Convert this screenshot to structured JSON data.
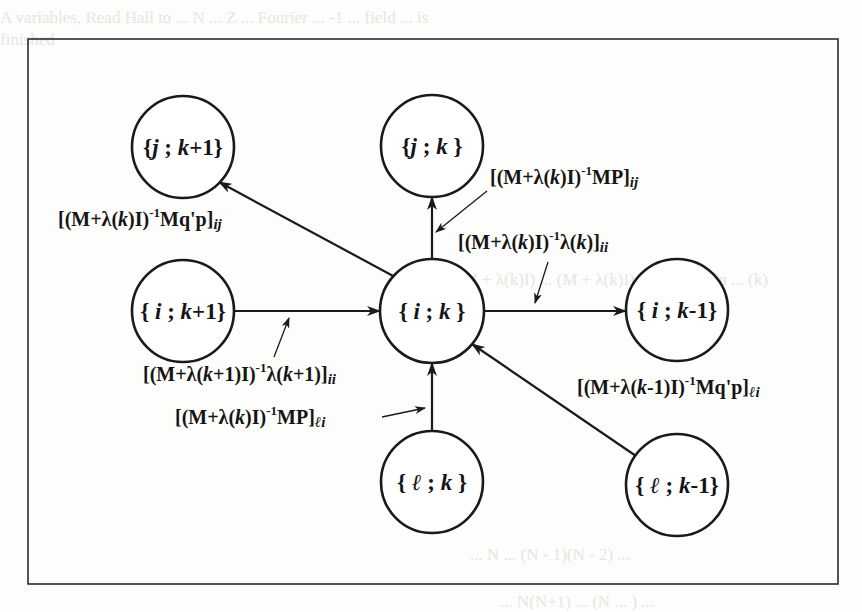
{
  "diagram": {
    "frame": {
      "x": 28,
      "y": 39,
      "width": 810,
      "height": 545
    },
    "nodes": [
      {
        "id": "j_k+1",
        "row": "j",
        "col": "k+1",
        "brace_open": "{",
        "var": "j",
        "sep": " ; ",
        "k": "k",
        "suffix": "+1",
        "brace_close": "}",
        "cx": 183,
        "cy": 147
      },
      {
        "id": "j_k",
        "row": "j",
        "col": "k",
        "brace_open": "{",
        "var": "j",
        "sep": " ; ",
        "k": "k",
        "suffix": " ",
        "brace_close": "}",
        "cx": 432,
        "cy": 146
      },
      {
        "id": "i_k+1",
        "row": "i",
        "col": "k+1",
        "brace_open": "{ ",
        "var": "i",
        "sep": " ; ",
        "k": "k",
        "suffix": "+1",
        "brace_close": "}",
        "cx": 183,
        "cy": 311
      },
      {
        "id": "i_k",
        "row": "i",
        "col": "k",
        "brace_open": "{ ",
        "var": "i",
        "sep": " ; ",
        "k": "k",
        "suffix": " ",
        "brace_close": "}",
        "cx": 432,
        "cy": 311
      },
      {
        "id": "i_k-1",
        "row": "i",
        "col": "k-1",
        "brace_open": "{ ",
        "var": "i",
        "sep": " ; ",
        "k": "k",
        "suffix": "-1",
        "brace_close": "}",
        "cx": 677,
        "cy": 310
      },
      {
        "id": "l_k",
        "row": "ℓ",
        "col": "k",
        "brace_open": "{ ",
        "var": "ℓ",
        "sep": " ; ",
        "k": "k",
        "suffix": " ",
        "brace_close": "}",
        "cx": 432,
        "cy": 482
      },
      {
        "id": "l_k-1",
        "row": "ℓ",
        "col": "k-1",
        "brace_open": "{ ",
        "var": "ℓ",
        "sep": " ; ",
        "k": "k",
        "suffix": "-1",
        "brace_close": "}",
        "cx": 677,
        "cy": 485
      }
    ],
    "edges": [
      {
        "from": "i_k",
        "to": "j_k+1"
      },
      {
        "from": "i_k",
        "to": "j_k"
      },
      {
        "from": "i_k+1",
        "to": "i_k"
      },
      {
        "from": "i_k",
        "to": "i_k-1"
      },
      {
        "from": "l_k",
        "to": "i_k"
      },
      {
        "from": "l_k-1",
        "to": "i_k"
      }
    ],
    "labels": {
      "i_k_to_j_k1": {
        "pre": "[(M+λ(",
        "var": "k",
        "mid": ")I)",
        "sup": "-1",
        "post": "Mq'p]",
        "sub": "ij"
      },
      "i_k_to_j_k_mp": {
        "pre": "[(M+λ(",
        "var": "k",
        "mid": ")I)",
        "sup": "-1",
        "post": "MP]",
        "sub": "ij"
      },
      "i_k_self_lambda": {
        "pre": "[(M+λ(",
        "var": "k",
        "mid": ")I)",
        "sup": "-1",
        "post_pre": "λ(",
        "post_var": "k",
        "post": ")]",
        "sub": "ii"
      },
      "i_k1_to_i_k": {
        "pre": "[(M+λ(",
        "var": "k",
        "mid": "+1)I)",
        "sup": "-1",
        "post_pre": "λ(",
        "post_var": "k",
        "post": "+1)]",
        "sub": "ii"
      },
      "l_k_to_i_k": {
        "pre": "[(M+λ(",
        "var": "k",
        "mid": ")I)",
        "sup": "-1",
        "post": "MP]",
        "sub": "ℓi"
      },
      "l_k1_to_i_k": {
        "pre": "[(M+λ(",
        "var": "k",
        "mid": "-1)I)",
        "sup": "-1",
        "post": "Mq'p]",
        "sub": "ℓi"
      }
    }
  },
  "background_text": {
    "line1": "A variables, Read Hall to ... N ... Z ... Fourier ... -1 ... field ... is",
    "line2": "finished",
    "line3": "Notes have presented so that all the constraint from the ... relation ... are",
    "line4": "Theorem 6.3.2 The ... to ... sequence ... of the ... M ... of",
    "line5": "... (M + λ(k)I) ... (M + λ(k)I)-1 ... function ... (k)",
    "line6": "Let",
    "line7": "... N ... (N - 1)(N - 2) ...",
    "line8": "... N(N+1) ... (N ... ) ..."
  }
}
